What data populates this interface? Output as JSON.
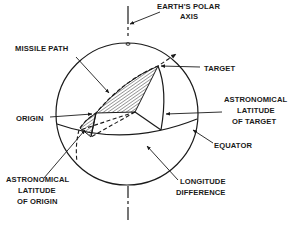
{
  "diagram": {
    "labels": {
      "polar_axis": [
        "EARTH'S POLAR",
        "AXIS"
      ],
      "missile_path": "MISSILE PATH",
      "target": "TARGET",
      "origin": "ORIGIN",
      "latitude_target": [
        "ASTRONOMICAL",
        "LATITUDE",
        "OF TARGET"
      ],
      "equator": "EQUATOR",
      "latitude_origin": [
        "ASTRONOMICAL",
        "LATITUDE",
        "OF ORIGIN"
      ],
      "longitude_difference": [
        "LONGITUDE",
        "DIFFERENCE"
      ]
    },
    "nodes": [
      {
        "id": "earth",
        "label": "Earth sphere"
      },
      {
        "id": "polar_axis",
        "label": "EARTH'S POLAR AXIS"
      },
      {
        "id": "origin",
        "label": "ORIGIN"
      },
      {
        "id": "target",
        "label": "TARGET"
      },
      {
        "id": "equator",
        "label": "EQUATOR"
      },
      {
        "id": "center",
        "label": "Earth center"
      }
    ],
    "edges": [
      {
        "from": "origin",
        "to": "target",
        "label": "MISSILE PATH",
        "style": "dashed-arc"
      },
      {
        "from": "center",
        "to": "target",
        "label": "ASTRONOMICAL LATITUDE OF TARGET"
      },
      {
        "from": "center",
        "to": "origin",
        "label": "ASTRONOMICAL LATITUDE OF ORIGIN",
        "style": "dashed"
      },
      {
        "from": "origin_meridian",
        "to": "target_meridian",
        "label": "LONGITUDE DIFFERENCE"
      }
    ],
    "colors": {
      "ink": "#1a1a1a",
      "background": "#ffffff"
    }
  }
}
